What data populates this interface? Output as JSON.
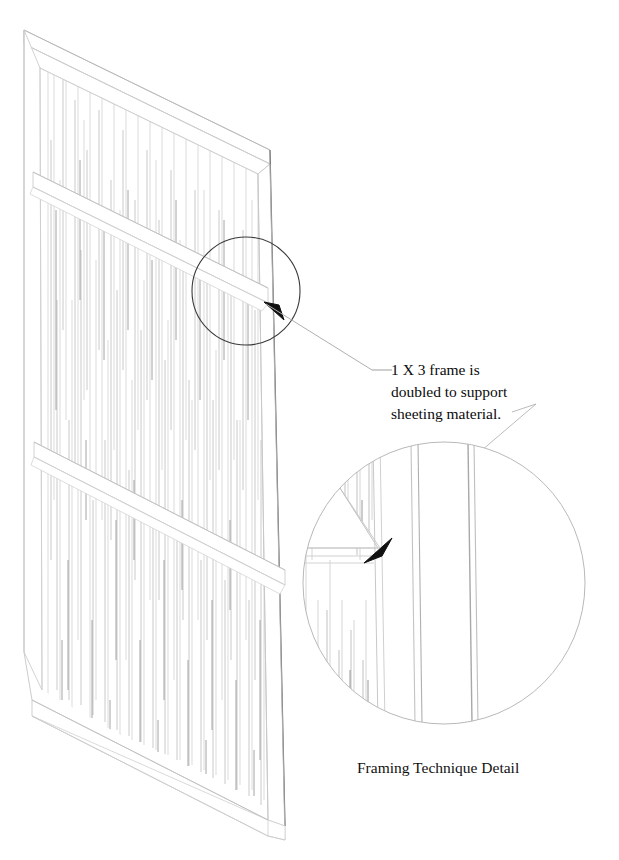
{
  "drawing": {
    "kind": "isometric-technical-illustration",
    "background_color": "#ffffff",
    "ink_color": "#000000",
    "line_color_light": "#c9c9c9",
    "line_color_mid": "#9a9a9a",
    "line_color_dark": "#4a4a4a",
    "grain_color": "#b4b4b4"
  },
  "annotation": {
    "line1": "1 X 3 frame is",
    "line2": "doubled to support",
    "line3": "sheeting material."
  },
  "caption": {
    "text": "Framing Technique Detail"
  },
  "callout": {
    "name": "callout-circle",
    "center_x": 246,
    "center_y": 291,
    "radius": 54,
    "stroke": "#3a3a3a"
  },
  "detail": {
    "name": "detail-circle",
    "center_x": 444,
    "center_y": 583,
    "radius": 141,
    "stroke": "#b9b9b9"
  },
  "panel": {
    "name": "framed-panel",
    "top_left_x": 24,
    "top_left_y": 30,
    "top_right_x": 270,
    "top_right_y": 150,
    "bottom_left_x": 32,
    "bottom_left_y": 700,
    "bottom_right_x": 285,
    "bottom_right_y": 840,
    "rail_count": 2
  },
  "arrows": {
    "callout_arrow": "arrow-up-left",
    "detail_arrow": "arrow-down-left"
  },
  "grain": {
    "description": "vertical wood-grain hatching on sheeting material",
    "line_count": 150
  }
}
